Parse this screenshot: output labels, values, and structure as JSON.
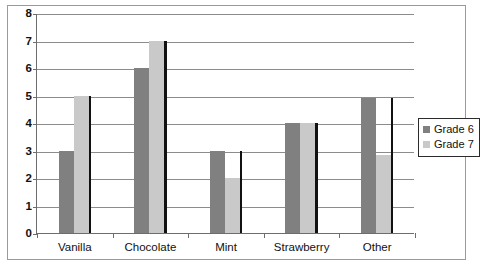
{
  "chart_data": {
    "type": "bar",
    "title": "",
    "subtitle": "",
    "xlabel": "",
    "ylabel": "",
    "categories": [
      "Vanilla",
      "Chocolate",
      "Mint",
      "Strawberry",
      "Other"
    ],
    "series": [
      {
        "name": "Grade 6",
        "color": "#808080",
        "values": [
          3,
          6,
          3,
          4,
          4.9
        ]
      },
      {
        "name": "Grade 7",
        "color": "#c9c9c9",
        "values": [
          5,
          7,
          2,
          4,
          2.85
        ]
      }
    ],
    "ylim": [
      0,
      8
    ],
    "yticks": [
      0,
      1,
      2,
      3,
      4,
      5,
      6,
      7,
      8
    ],
    "ytick_labels": [
      "0",
      "1",
      "2",
      "3",
      "4",
      "5",
      "6",
      "7",
      "8"
    ],
    "grid": true,
    "grid_axis": "y",
    "legend_position": "right",
    "annotations": []
  },
  "legend": {
    "entries": [
      {
        "label": "Grade 6",
        "color": "#808080"
      },
      {
        "label": "Grade 7",
        "color": "#c9c9c9"
      }
    ]
  },
  "colors": {
    "grade6": "#808080",
    "grade7": "#c9c9c9",
    "axis": "#6d6d6d",
    "grid": "#8c8c8c",
    "frame": "#9a9a9a",
    "bar_shadow": "#111111",
    "text": "#111111",
    "background": "#ffffff"
  }
}
